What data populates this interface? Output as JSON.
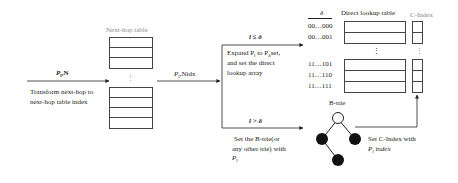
{
  "nexthop_table": {
    "title": "Next-hop table",
    "dots": "⋮"
  },
  "input_label": {
    "prefix_sym": "P",
    "prefix_sub": "l",
    "rest": ",N"
  },
  "transform_text": [
    "Transform next-hop to",
    "next-hop table index"
  ],
  "mid_label": {
    "prefix_sym": "P",
    "prefix_sub": "l",
    "rest": ",Nidx"
  },
  "branch_le": {
    "condition": "l ≤ δ",
    "text": [
      "Expand P",
      "l",
      " to P",
      "δ",
      "set,"
    ],
    "line2": "and set the direct",
    "line3": "lookup array"
  },
  "branch_gt": {
    "condition": "l > δ",
    "line1": "Set the B-trie(or",
    "line2": "any other trie) with",
    "line3_sym": "P",
    "line3_sub": "l"
  },
  "direct_lookup": {
    "title": "Direct lookup table",
    "delta_header": "δ",
    "indices_top": [
      "00…000",
      "00…001"
    ],
    "indices_bottom": [
      "11…101",
      "11…110",
      "11…111"
    ],
    "dots": "⋮"
  },
  "cindex": {
    "title": "C-Index",
    "dots": "⋮"
  },
  "btrie": {
    "title": "B-trie"
  },
  "set_cindex": {
    "line1": "Set C-Index with",
    "line2_sym": "P",
    "line2_sub": "l",
    "line2_rest": " index"
  }
}
